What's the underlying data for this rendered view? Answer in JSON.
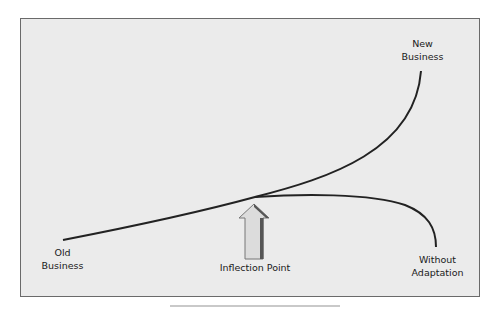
{
  "diagram": {
    "type": "curve-diagram",
    "labels": {
      "old_business": [
        "Old",
        "Business"
      ],
      "new_business": [
        "New",
        "Business"
      ],
      "without_adaptation": [
        "Without",
        "Adaptation"
      ],
      "inflection_point": "Inflection Point"
    },
    "colors": {
      "background": "#ebebeb",
      "border": "#6a6a6a",
      "curve": "#222222",
      "arrow_fill": "#dcdcdc",
      "arrow_shadow": "#555555"
    }
  }
}
